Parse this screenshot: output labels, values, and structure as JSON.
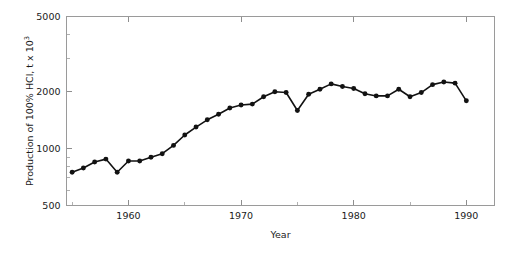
{
  "chart_data": {
    "type": "line",
    "title": "",
    "subtitle": "",
    "xlabel": "Year",
    "ylabel": "Production of 100% HCl, t x 10",
    "ylabel_exponent": "3",
    "yscale": "log",
    "xscale": "linear",
    "xlim": [
      1954.5,
      1992.5
    ],
    "ylim": [
      500,
      5000
    ],
    "grid": false,
    "legend": false,
    "legend_position": "none",
    "marker": "filled-circle",
    "line_color": "#121212",
    "axis_color": "#9a9a9a",
    "yticks": [
      500,
      1000,
      2000,
      5000
    ],
    "ytick_labels": [
      "500",
      "1000",
      "2000",
      "5000"
    ],
    "yticks_minor": [
      600,
      700,
      800,
      900,
      3000,
      4000
    ],
    "xticks": [
      1960,
      1970,
      1980,
      1990
    ],
    "xtick_labels": [
      "1960",
      "1970",
      "1980",
      "1990"
    ],
    "xticks_minor": [
      1955,
      1965,
      1975,
      1985
    ],
    "x": [
      1955,
      1956,
      1957,
      1958,
      1959,
      1960,
      1961,
      1962,
      1963,
      1964,
      1965,
      1966,
      1967,
      1968,
      1969,
      1970,
      1971,
      1972,
      1973,
      1974,
      1975,
      1976,
      1977,
      1978,
      1979,
      1980,
      1981,
      1982,
      1983,
      1984,
      1985,
      1986,
      1987,
      1988,
      1989,
      1990
    ],
    "values": [
      750,
      790,
      850,
      880,
      750,
      860,
      860,
      900,
      940,
      1040,
      1180,
      1300,
      1420,
      1520,
      1640,
      1700,
      1720,
      1880,
      2000,
      1980,
      1590,
      1940,
      2060,
      2200,
      2130,
      2080,
      1950,
      1900,
      1900,
      2060,
      1880,
      1980,
      2180,
      2250,
      2220,
      1790
    ],
    "series": [
      {
        "name": "Production of 100% HCl",
        "values": [
          750,
          790,
          850,
          880,
          750,
          860,
          860,
          900,
          940,
          1040,
          1180,
          1300,
          1420,
          1520,
          1640,
          1700,
          1720,
          1880,
          2000,
          1980,
          1590,
          1940,
          2060,
          2200,
          2130,
          2080,
          1950,
          1900,
          1900,
          2060,
          1880,
          1980,
          2180,
          2250,
          2220,
          1790
        ]
      }
    ],
    "units": "t x 10^3",
    "annotations": []
  }
}
